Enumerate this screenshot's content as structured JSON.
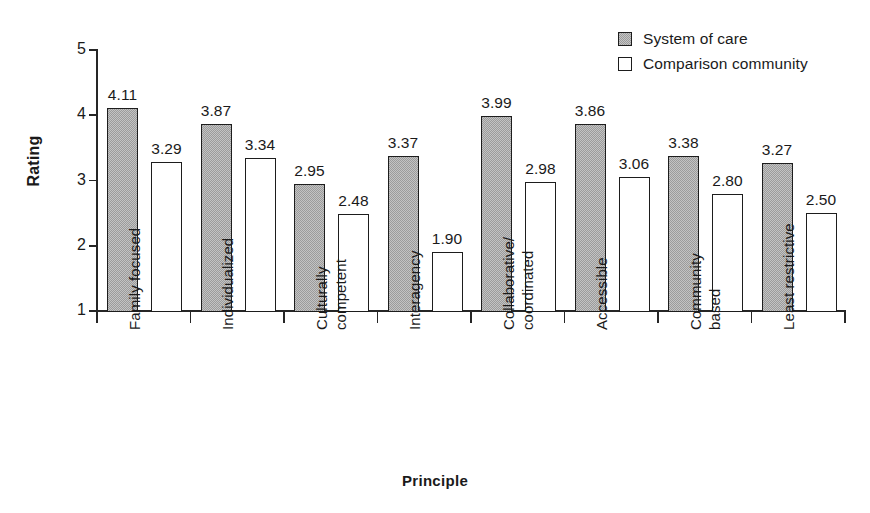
{
  "chart_data": {
    "type": "bar",
    "title": "",
    "xlabel": "Principle",
    "ylabel": "Rating",
    "ylim": [
      1,
      5
    ],
    "yticks": [
      "1",
      "2",
      "3",
      "4",
      "5"
    ],
    "grid": false,
    "legend_position": "top-right",
    "categories": [
      "Family focused",
      "Individualized",
      "Culturally competent",
      "Interagency",
      "Collaborative/ coordinated",
      "Accessible",
      "Community based",
      "Least restrictive"
    ],
    "category_lines": [
      [
        "Family focused"
      ],
      [
        "Individualized"
      ],
      [
        "Culturally",
        "competent"
      ],
      [
        "Interagency"
      ],
      [
        "Collaborative/",
        "coordinated"
      ],
      [
        "Accessible"
      ],
      [
        "Community",
        "based"
      ],
      [
        "Least restrictive"
      ]
    ],
    "series": [
      {
        "name": "System of care",
        "style": "filled-gray",
        "color": "#9b9b9b",
        "values": [
          4.11,
          3.87,
          2.95,
          3.37,
          3.99,
          3.86,
          3.38,
          3.27
        ],
        "labels": [
          "4.11",
          "3.87",
          "2.95",
          "3.37",
          "3.99",
          "3.86",
          "3.38",
          "3.27"
        ]
      },
      {
        "name": "Comparison community",
        "style": "open-white",
        "color": "#ffffff",
        "values": [
          3.29,
          3.34,
          2.48,
          1.9,
          2.98,
          3.06,
          2.8,
          2.5
        ],
        "labels": [
          "3.29",
          "3.34",
          "2.48",
          "1.90",
          "2.98",
          "3.06",
          "2.80",
          "2.50"
        ]
      }
    ]
  },
  "legend": {
    "entries": [
      {
        "label": "System of care"
      },
      {
        "label": "Comparison community"
      }
    ]
  },
  "axis": {
    "y_title": "Rating",
    "x_title": "Principle"
  }
}
